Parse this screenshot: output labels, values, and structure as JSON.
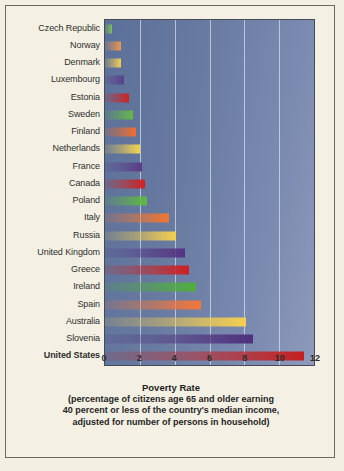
{
  "caption": {
    "title": "Poverty Rate",
    "line1": "(percentage of citizens age 65 and older earning",
    "line2": "40 percent or less of the country's median income,",
    "line3": "adjusted for number of persons in household)"
  },
  "chart_data": {
    "type": "bar",
    "orientation": "horizontal",
    "title": "Poverty Rate",
    "xlabel": "Poverty Rate",
    "ylabel": "",
    "xlim": [
      0,
      12
    ],
    "xticks": [
      "0",
      "2",
      "4",
      "6",
      "8",
      "10",
      "12"
    ],
    "gridlines": [
      2,
      4,
      6,
      8,
      10
    ],
    "grid": true,
    "legend": "none",
    "categories": [
      "Czech Republic",
      "Norway",
      "Denmark",
      "Luxembourg",
      "Estonia",
      "Sweden",
      "Finland",
      "Netherlands",
      "France",
      "Canada",
      "Poland",
      "Italy",
      "Russia",
      "United Kingdom",
      "Greece",
      "Ireland",
      "Spain",
      "Australia",
      "Slovenia",
      "United States"
    ],
    "values": [
      0.4,
      0.9,
      0.9,
      1.1,
      1.4,
      1.6,
      1.8,
      2.0,
      2.1,
      2.3,
      2.4,
      3.7,
      4.1,
      4.6,
      4.8,
      5.2,
      5.5,
      8.1,
      8.5,
      11.4
    ],
    "bar_colors": [
      "#7dc352",
      "#f0954f",
      "#f5cf52",
      "#5b3f87",
      "#cf2222",
      "#63b845",
      "#f26d2b",
      "#f5d34f",
      "#5a3b87",
      "#d02020",
      "#5fb93f",
      "#f2762f",
      "#f3cf4f",
      "#543382",
      "#cc2020",
      "#4fae3c",
      "#f2763a",
      "#f5cf4f",
      "#4e2f7d",
      "#c41f1f"
    ],
    "bold_categories": [
      "United States"
    ]
  }
}
